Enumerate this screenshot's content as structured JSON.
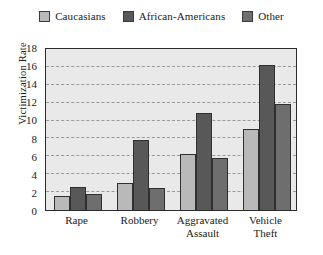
{
  "chart_data": {
    "type": "bar",
    "title": "",
    "subtitle": "",
    "xlabel": "",
    "ylabel": "Victimization Rate",
    "categories": [
      "Rape",
      "Robbery",
      "Aggravated Assault",
      "Vehicle Theft"
    ],
    "category_lines": [
      [
        "Rape"
      ],
      [
        "Robbery"
      ],
      [
        "Aggravated",
        "Assault"
      ],
      [
        "Vehicle",
        "Theft"
      ]
    ],
    "series": [
      {
        "name": "Caucasians",
        "color": "#b9b9b9",
        "values": [
          1.6,
          3.0,
          6.2,
          8.9
        ]
      },
      {
        "name": "African-Americans",
        "color": "#585858",
        "values": [
          2.5,
          7.7,
          10.7,
          16.0
        ]
      },
      {
        "name": "Other",
        "color": "#6e6e6e",
        "values": [
          1.8,
          2.4,
          5.7,
          11.7
        ]
      }
    ],
    "ylim": [
      0,
      18
    ],
    "yticks": [
      0,
      2,
      4,
      6,
      8,
      10,
      12,
      14,
      16,
      18
    ],
    "ytick_labels": [
      "0",
      "2",
      "4",
      "6",
      "8",
      "10",
      "12",
      "14",
      "16",
      "18"
    ],
    "grid": true,
    "grid_axis": "y",
    "grid_style": "dashed",
    "legend_position": "top-center",
    "plot_background": "#e9e9e9",
    "axis_color": "#2b2b2b",
    "bar_edge_color": "#2f2f2f"
  }
}
